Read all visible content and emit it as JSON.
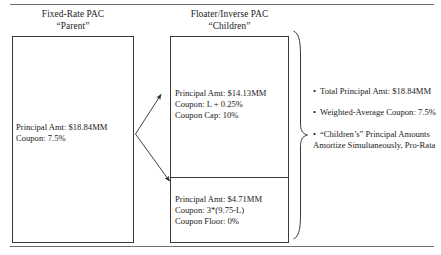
{
  "figure": {
    "rules": {
      "top": "horizontal-rule",
      "bottom": "horizontal-rule"
    }
  },
  "headers": {
    "parent": {
      "line1": "Fixed-Rate PAC",
      "line2": "“Parent”"
    },
    "children": {
      "line1": "Floater/Inverse PAC",
      "line2": "“Children”"
    }
  },
  "parent_box": {
    "line1": "Principal Amt: $18.84MM",
    "line2": "Coupon: 7.5%"
  },
  "child_floater_box": {
    "line1": "Principal Amt: $14.13MM",
    "line2": "Coupon: L + 0.25%",
    "line3": "Coupon Cap: 10%"
  },
  "child_inverse_box": {
    "line1": "Principal Amt: $4.71MM",
    "line2": "Coupon: 3*(9.75-L)",
    "line3": "Coupon Floor: 0%"
  },
  "bullets": [
    {
      "marker": "•",
      "text": "Total Principal Amt: $18.84MM"
    },
    {
      "marker": "•",
      "text": "Weighted-Average Coupon: 7.5%"
    },
    {
      "marker": "•",
      "text": "“Children’s” Principal Amounts Amortize Simultaneously, Pro-Rata"
    }
  ],
  "colors": {
    "rule": "#6e6e6e",
    "box_border": "#3a3a3a",
    "text": "#1a1a1a",
    "background": "#ffffff"
  }
}
